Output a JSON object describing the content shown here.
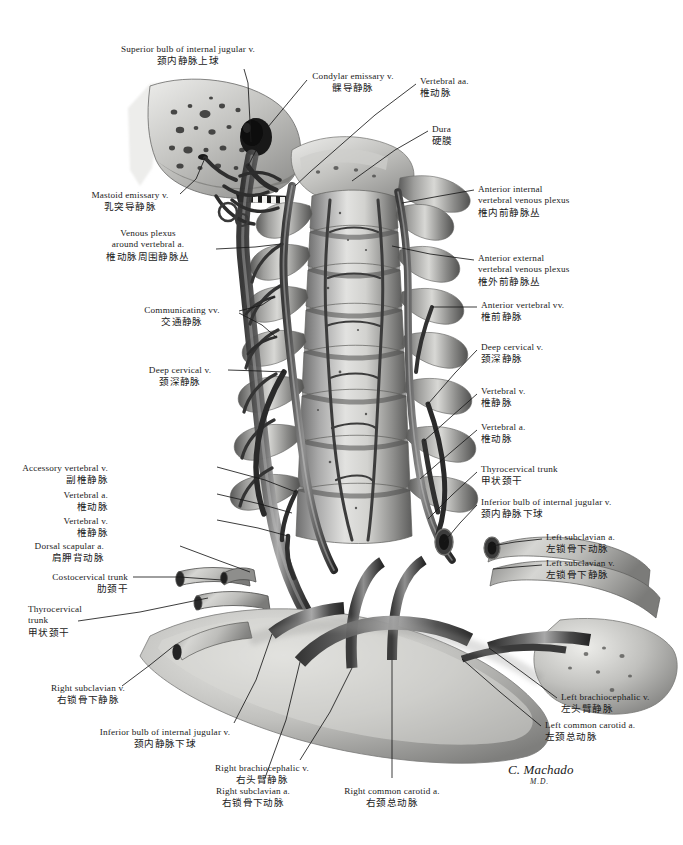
{
  "plate": {
    "title": "Veins of the vertebral column and neck — anterior view",
    "width": 683,
    "height": 845,
    "background_color": "#ffffff",
    "ink_color": "#1a1a1a",
    "artwork_style": "grayscale airbrush medical illustration"
  },
  "signature": {
    "name": "C. Machado",
    "credential": "M.D."
  },
  "labels": [
    {
      "id": "superior-bulb-internal-jugular-v",
      "en": "Superior bulb of internal jugular v.",
      "zh": "颈内静脉上球",
      "align": "center",
      "x": 188,
      "y": 44,
      "leader": [
        [
          244,
          69
        ],
        [
          248,
          83
        ],
        [
          251,
          142
        ]
      ]
    },
    {
      "id": "condylar-emissary-v",
      "en": "Condylar emissary v.",
      "zh": "髁导静脉",
      "align": "center",
      "x": 353,
      "y": 71,
      "leader": [
        [
          307,
          80
        ],
        [
          268,
          127
        ],
        [
          248,
          166
        ]
      ]
    },
    {
      "id": "vertebral-aa",
      "en": "Vertebral aa.",
      "zh": "椎动脉",
      "align": "left",
      "x": 420,
      "y": 76,
      "leader": [
        [
          416,
          84
        ],
        [
          375,
          115
        ],
        [
          310,
          172
        ],
        [
          295,
          186
        ]
      ]
    },
    {
      "id": "dura",
      "en": "Dura",
      "zh": "硬膜",
      "align": "left",
      "x": 432,
      "y": 124,
      "leader": [
        [
          428,
          131
        ],
        [
          395,
          150
        ],
        [
          352,
          181
        ]
      ]
    },
    {
      "id": "mastoid-emissary-v",
      "en": "Mastoid emissary v.",
      "zh": "乳突导静脉",
      "align": "center",
      "x": 130,
      "y": 190,
      "leader": [
        [
          180,
          194
        ],
        [
          196,
          179
        ],
        [
          205,
          158
        ]
      ]
    },
    {
      "id": "venous-plexus-around-vertebral-a",
      "en": [
        "Venous plexus",
        "around vertebral a."
      ],
      "zh": "椎动脉周围静脉丛",
      "align": "center",
      "x": 148,
      "y": 228,
      "leader": [
        [
          216,
          249
        ],
        [
          255,
          247
        ],
        [
          281,
          244
        ]
      ]
    },
    {
      "id": "anterior-internal-vertebral-venous-plexus",
      "en": [
        "Anterior internal",
        "vertebral venous plexus"
      ],
      "zh": "椎内前静脉丛",
      "align": "left",
      "x": 478,
      "y": 184,
      "leader": [
        [
          474,
          190
        ],
        [
          440,
          196
        ],
        [
          402,
          203
        ]
      ]
    },
    {
      "id": "anterior-external-vertebral-venous-plexus",
      "en": [
        "Anterior external",
        "vertebral venous plexus"
      ],
      "zh": "椎外前静脉丛",
      "align": "left",
      "x": 478,
      "y": 253,
      "leader": [
        [
          474,
          260
        ],
        [
          430,
          254
        ],
        [
          392,
          246
        ]
      ]
    },
    {
      "id": "communicating-vv",
      "en": "Communicating vv.",
      "zh": "交通静脉",
      "align": "center",
      "x": 182,
      "y": 305,
      "leader": [
        [
          239,
          311
        ],
        [
          262,
          305
        ],
        [
          274,
          297
        ]
      ],
      "leader2": [
        [
          239,
          313
        ],
        [
          262,
          325
        ],
        [
          276,
          337
        ]
      ]
    },
    {
      "id": "deep-cervical-v-left",
      "en": "Deep cervical v.",
      "zh": "颈深静脉",
      "align": "center",
      "x": 180,
      "y": 365,
      "leader": [
        [
          228,
          370
        ],
        [
          260,
          371
        ],
        [
          284,
          372
        ]
      ]
    },
    {
      "id": "anterior-vertebral-vv",
      "en": "Anterior vertebral vv.",
      "zh": "椎前静脉",
      "align": "left",
      "x": 481,
      "y": 300,
      "leader": [
        [
          477,
          307
        ],
        [
          455,
          307
        ],
        [
          432,
          307
        ]
      ]
    },
    {
      "id": "deep-cervical-v-right",
      "en": "Deep cervical v.",
      "zh": "颈深静脉",
      "align": "left",
      "x": 481,
      "y": 342,
      "leader": [
        [
          477,
          350
        ],
        [
          455,
          373
        ],
        [
          428,
          404
        ]
      ]
    },
    {
      "id": "vertebral-v-right",
      "en": "Vertebral v.",
      "zh": "椎静脉",
      "align": "left",
      "x": 481,
      "y": 386,
      "leader": [
        [
          477,
          394
        ],
        [
          452,
          416
        ],
        [
          424,
          441
        ]
      ]
    },
    {
      "id": "vertebral-a-right",
      "en": "Vertebral a.",
      "zh": "椎动脉",
      "align": "left",
      "x": 481,
      "y": 422,
      "leader": [
        [
          477,
          430
        ],
        [
          450,
          453
        ],
        [
          420,
          479
        ]
      ]
    },
    {
      "id": "accessory-vertebral-v",
      "en": "Accessory vertebral v.",
      "zh": "副椎静脉",
      "align": "right",
      "x": 108,
      "y": 463,
      "leader": [
        [
          217,
          467
        ],
        [
          265,
          480
        ],
        [
          296,
          492
        ]
      ]
    },
    {
      "id": "vertebral-a-left",
      "en": "Vertebral a.",
      "zh": "椎动脉",
      "align": "right",
      "x": 108,
      "y": 490,
      "leader": [
        [
          217,
          494
        ],
        [
          260,
          504
        ],
        [
          292,
          513
        ]
      ]
    },
    {
      "id": "vertebral-v-left",
      "en": "Vertebral v.",
      "zh": "椎静脉",
      "align": "right",
      "x": 108,
      "y": 516,
      "leader": [
        [
          217,
          520
        ],
        [
          258,
          528
        ],
        [
          288,
          536
        ]
      ]
    },
    {
      "id": "dorsal-scapular-a",
      "en": "Dorsal scapular a.",
      "zh": "肩胛背动脉",
      "align": "right",
      "x": 104,
      "y": 541,
      "leader": [
        [
          180,
          546
        ],
        [
          220,
          561
        ],
        [
          250,
          572
        ]
      ]
    },
    {
      "id": "costocervical-trunk",
      "en": "Costocervical trunk",
      "zh": "肋颈干",
      "align": "right",
      "x": 128,
      "y": 572,
      "leader": [
        [
          133,
          577
        ],
        [
          180,
          577
        ],
        [
          222,
          580
        ]
      ]
    },
    {
      "id": "thyrocervical-trunk-left",
      "en": [
        "Thyrocervical",
        "trunk"
      ],
      "zh": "甲状颈干",
      "align": "left",
      "x": 28,
      "y": 604,
      "leader": [
        [
          78,
          621
        ],
        [
          140,
          612
        ],
        [
          208,
          598
        ]
      ]
    },
    {
      "id": "thyrocervical-trunk-right",
      "en": "Thyrocervical trunk",
      "zh": "甲状颈干",
      "align": "left",
      "x": 481,
      "y": 464,
      "leader": [
        [
          477,
          472
        ],
        [
          452,
          495
        ],
        [
          428,
          519
        ]
      ]
    },
    {
      "id": "inferior-bulb-internal-jugular-v-right",
      "en": "Inferior bulb of internal jugular v.",
      "zh": "颈内静脉下球",
      "align": "left",
      "x": 481,
      "y": 497,
      "leader": [
        [
          477,
          505
        ],
        [
          460,
          523
        ],
        [
          444,
          542
        ]
      ]
    },
    {
      "id": "left-subclavian-a",
      "en": "Left subclavian a.",
      "zh": "左锁骨下动脉",
      "align": "left",
      "x": 546,
      "y": 532,
      "leader": [
        [
          542,
          539
        ],
        [
          515,
          542
        ],
        [
          492,
          546
        ]
      ]
    },
    {
      "id": "left-subclavian-v",
      "en": "Left subclavian v.",
      "zh": "左锁骨下静脉",
      "align": "left",
      "x": 546,
      "y": 558,
      "leader": [
        [
          542,
          565
        ],
        [
          516,
          567
        ],
        [
          493,
          569
        ]
      ]
    },
    {
      "id": "right-subclavian-v",
      "en": "Right subclavian v.",
      "zh": "右锁骨下静脉",
      "align": "center",
      "x": 88,
      "y": 683,
      "leader": [
        [
          122,
          686
        ],
        [
          150,
          665
        ],
        [
          175,
          645
        ]
      ]
    },
    {
      "id": "inferior-bulb-internal-jugular-v-left",
      "en": "Inferior bulb of internal jugular v.",
      "zh": "颈内静脉下球",
      "align": "center",
      "x": 165,
      "y": 727,
      "leader": [
        [
          234,
          723
        ],
        [
          256,
          680
        ],
        [
          272,
          634
        ]
      ]
    },
    {
      "id": "right-brachiocephalic-v",
      "en": "Right brachiocephalic v.",
      "zh": "右头臂静脉",
      "align": "center",
      "x": 262,
      "y": 763,
      "leader": [
        [
          300,
          760
        ],
        [
          330,
          712
        ],
        [
          352,
          668
        ]
      ]
    },
    {
      "id": "right-subclavian-a",
      "en": "Right subclavian a.",
      "zh": "右锁骨下动脉",
      "align": "center",
      "x": 253,
      "y": 786,
      "leader": [
        [
          265,
          778
        ],
        [
          286,
          720
        ],
        [
          300,
          662
        ]
      ]
    },
    {
      "id": "right-common-carotid-a",
      "en": "Right common carotid a.",
      "zh": "右颈总动脉",
      "align": "center",
      "x": 392,
      "y": 786,
      "leader": [
        [
          392,
          778
        ],
        [
          392,
          720
        ],
        [
          392,
          660
        ]
      ]
    },
    {
      "id": "left-brachiocephalic-v",
      "en": "Left brachiocephalic v.",
      "zh": "左头臂静脉",
      "align": "left",
      "x": 561,
      "y": 692,
      "leader": [
        [
          557,
          698
        ],
        [
          522,
          672
        ],
        [
          489,
          648
        ]
      ]
    },
    {
      "id": "left-common-carotid-a",
      "en": "Left common carotid a.",
      "zh": "左颈总动脉",
      "align": "left",
      "x": 545,
      "y": 720,
      "leader": [
        [
          541,
          726
        ],
        [
          500,
          692
        ],
        [
          462,
          659
        ]
      ]
    }
  ]
}
